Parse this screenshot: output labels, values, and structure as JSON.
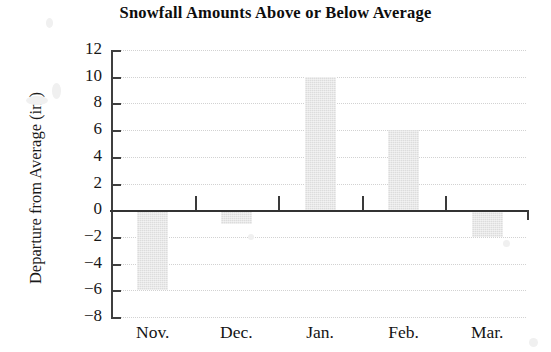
{
  "chart_data": {
    "type": "bar",
    "title": "Snowfall Amounts Above or Below Average",
    "xlabel": "",
    "ylabel": "Departure from Average (in.)",
    "categories": [
      "Nov.",
      "Dec.",
      "Jan.",
      "Feb.",
      "Mar."
    ],
    "values": [
      -6,
      -1,
      10,
      6,
      -2
    ],
    "series": [
      {
        "name": "Departure from Average",
        "values": [
          -6,
          -1,
          10,
          6,
          -2
        ]
      }
    ],
    "ylim": [
      -8,
      12
    ],
    "ytick_values": [
      12,
      10,
      8,
      6,
      4,
      2,
      0,
      -2,
      -4,
      -6,
      -8
    ],
    "ytick_labels": [
      "12",
      "10",
      "8",
      "6",
      "4",
      "2",
      "0",
      "−2",
      "−4",
      "−6",
      "−8"
    ],
    "grid": true,
    "grid_axis": "y",
    "legend": false,
    "legend_position": "none",
    "bar_color": "#dcdcdc",
    "zero_line_color": "#333333",
    "axis_color": "#3f3f3f",
    "grid_color": "#d2d2d2",
    "units": "in.",
    "annotations": []
  },
  "figure": {
    "background": "#ffffff",
    "title_text": "Snowfall Amounts Above or Below Average",
    "y_axis_title_text": "Departure from Average (in.)"
  }
}
